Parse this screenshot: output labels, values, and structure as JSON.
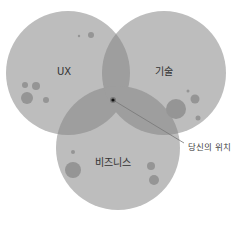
{
  "diagram": {
    "type": "venn",
    "circles": [
      {
        "id": "ux",
        "label": "UX",
        "cx": 68,
        "cy": 73,
        "r": 62
      },
      {
        "id": "tech",
        "label": "기술",
        "cx": 164,
        "cy": 73,
        "r": 62
      },
      {
        "id": "business",
        "label": "비즈니스",
        "cx": 118,
        "cy": 148,
        "r": 62
      }
    ],
    "marker": {
      "label": "당신의 위치",
      "x": 113,
      "y": 100
    },
    "colors": {
      "circle_fill": "#bdbdbd",
      "overlap_fill": "#9a9a9a",
      "spot_fill": "#909090",
      "marker": "#111111",
      "text": "#333333"
    }
  }
}
